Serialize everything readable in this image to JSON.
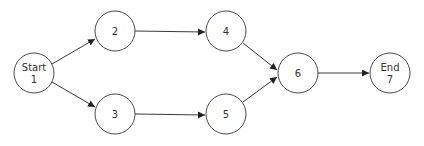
{
  "diagram": {
    "type": "network-flow",
    "nodes": [
      {
        "id": "1",
        "line1": "Start",
        "line2": "1",
        "cx": 34,
        "cy": 73
      },
      {
        "id": "2",
        "line1": "2",
        "line2": "",
        "cx": 115,
        "cy": 31
      },
      {
        "id": "3",
        "line1": "3",
        "line2": "",
        "cx": 115,
        "cy": 114
      },
      {
        "id": "4",
        "line1": "4",
        "line2": "",
        "cx": 226,
        "cy": 31
      },
      {
        "id": "5",
        "line1": "5",
        "line2": "",
        "cx": 226,
        "cy": 114
      },
      {
        "id": "6",
        "line1": "6",
        "line2": "",
        "cx": 298,
        "cy": 73
      },
      {
        "id": "7",
        "line1": "End",
        "line2": "7",
        "cx": 390,
        "cy": 73
      }
    ],
    "edges": [
      {
        "from": "1",
        "to": "2"
      },
      {
        "from": "1",
        "to": "3"
      },
      {
        "from": "2",
        "to": "4"
      },
      {
        "from": "3",
        "to": "5"
      },
      {
        "from": "4",
        "to": "6"
      },
      {
        "from": "5",
        "to": "6"
      },
      {
        "from": "6",
        "to": "7"
      }
    ],
    "node_radius": 20,
    "colors": {
      "stroke": "#4a4a4a",
      "text": "#333333",
      "background": "#ffffff"
    }
  }
}
